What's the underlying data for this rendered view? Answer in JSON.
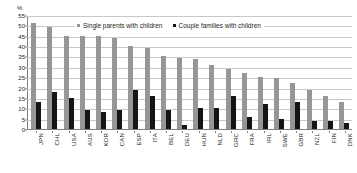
{
  "chart_data": {
    "type": "bar",
    "title": "",
    "xlabel": "",
    "ylabel": "%",
    "ylim": [
      0,
      55
    ],
    "yticks": [
      0,
      5,
      10,
      15,
      20,
      25,
      30,
      35,
      40,
      45,
      50,
      55
    ],
    "grid": true,
    "legend_position": "top",
    "categories": [
      "JPN",
      "CHL",
      "USA",
      "AUS",
      "KOR",
      "CAN",
      "ESP",
      "ITA",
      "BEL",
      "DEU",
      "HUN",
      "NLD",
      "GRC",
      "FRA",
      "IRL",
      "SWE",
      "GBR",
      "NZL",
      "FIN",
      "DNK"
    ],
    "series": [
      {
        "name": "Single parents with children",
        "color": "#969696",
        "values": [
          51,
          49,
          45,
          45,
          45,
          44,
          40,
          39,
          35,
          34.5,
          34,
          31,
          29,
          27,
          25,
          24.5,
          22,
          19,
          16,
          13
        ]
      },
      {
        "name": "Couple families with children",
        "color": "#151515",
        "values": [
          13,
          18,
          15,
          9,
          8,
          9,
          19,
          16,
          9,
          2,
          10,
          10,
          16,
          6,
          12,
          5,
          13,
          4,
          4,
          3
        ]
      }
    ]
  },
  "axis": {
    "unit": "%"
  },
  "legend": {
    "items": [
      {
        "label": "Single parents with children"
      },
      {
        "label": "Couple families with children"
      }
    ]
  }
}
